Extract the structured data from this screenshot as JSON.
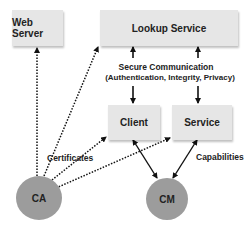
{
  "nodes": {
    "web_server": "Web Server",
    "lookup_service": "Lookup Service",
    "client": "Client",
    "service": "Service",
    "ca": "CA",
    "cm": "CM"
  },
  "labels": {
    "secure_comm_line1": "Secure Communication",
    "secure_comm_line2": "(Authentication, Integrity, Privacy)",
    "certificates": "Certificates",
    "capabilities": "Capabilities"
  },
  "colors": {
    "box_fill": "#e6e6e6",
    "circle_fill": "#9c9c9c",
    "edge": "#111111"
  }
}
